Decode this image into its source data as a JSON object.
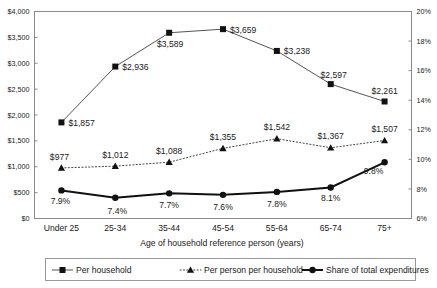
{
  "chart_data": {
    "type": "line",
    "title": "",
    "xlabel": "Age of household reference person (years)",
    "ylabel": "",
    "categories": [
      "Under 25",
      "25-34",
      "35-44",
      "45-54",
      "55-64",
      "65-74",
      "75+"
    ],
    "grid": false,
    "legend_position": "bottom",
    "axes": {
      "left": {
        "ylim": [
          0,
          4000
        ],
        "ticks": [
          0,
          500,
          1000,
          1500,
          2000,
          2500,
          3000,
          3500,
          4000
        ],
        "tick_labels": [
          "$0",
          "$500",
          "$1,000",
          "$1,500",
          "$2,000",
          "$2,500",
          "$3,000",
          "$3,500",
          "$4,000"
        ]
      },
      "right": {
        "ylim": [
          6,
          20
        ],
        "ticks": [
          6,
          8,
          10,
          12,
          14,
          16,
          18,
          20
        ],
        "tick_labels": [
          "6%",
          "8%",
          "10%",
          "12%",
          "14%",
          "16%",
          "18%",
          "20%"
        ]
      }
    },
    "series": [
      {
        "name": "Per household",
        "axis": "left",
        "marker": "square",
        "line": "solid-thin",
        "values": [
          1857,
          2936,
          3589,
          3659,
          3238,
          2597,
          2261
        ],
        "data_labels": [
          "$1,857",
          "$2,936",
          "$3,589",
          "$3,659",
          "$3,238",
          "$2,597",
          "$2,261"
        ]
      },
      {
        "name": "Per person per household",
        "axis": "left",
        "marker": "triangle",
        "line": "dotted",
        "values": [
          977,
          1012,
          1088,
          1355,
          1542,
          1367,
          1507
        ],
        "data_labels": [
          "$977",
          "$1,012",
          "$1,088",
          "$1,355",
          "$1,542",
          "$1,367",
          "$1,507"
        ]
      },
      {
        "name": "Share of total expenditures",
        "axis": "right",
        "marker": "circle",
        "line": "solid-thick",
        "values": [
          7.9,
          7.4,
          7.7,
          7.6,
          7.8,
          8.1,
          9.8
        ],
        "data_labels": [
          "7.9%",
          "7.4%",
          "7.7%",
          "7.6%",
          "7.8%",
          "8.1%",
          "9.8%"
        ]
      }
    ]
  },
  "legend": {
    "items": [
      {
        "label": "Per household"
      },
      {
        "label": "Per person per household"
      },
      {
        "label": "Share of total expenditures"
      }
    ]
  },
  "colors": {
    "background": "#ffffff",
    "axis": "#8a8a8a",
    "series_thin": "#555555",
    "series_dotted": "#444444",
    "series_thick": "#111111",
    "text": "#1a1a1a"
  }
}
